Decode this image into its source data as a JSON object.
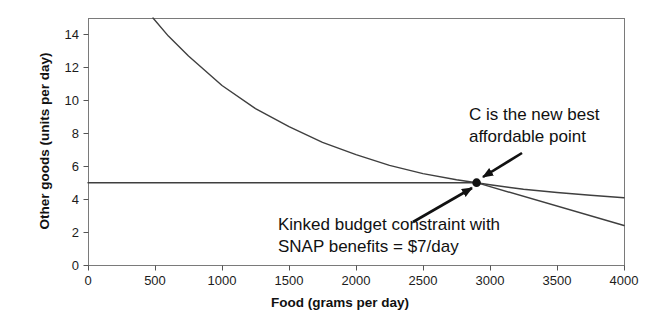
{
  "colors": {
    "curve_line": "#3f3f3f",
    "frame": "#7a7a7a",
    "tick": "#555555",
    "text": "#111111",
    "point_and_arrows": "#111111",
    "background": "#ffffff"
  },
  "chart_data": {
    "type": "line",
    "title": "",
    "xlabel": "Food (grams per day)",
    "ylabel": "Other goods (units per day)",
    "xlim": [
      0,
      4000
    ],
    "ylim": [
      0,
      15
    ],
    "x_ticks": [
      0,
      500,
      1000,
      1500,
      2000,
      2500,
      3000,
      3500,
      4000
    ],
    "y_ticks": [
      0,
      2,
      4,
      6,
      8,
      10,
      12,
      14
    ],
    "grid": false,
    "legend": false,
    "series": [
      {
        "name": "indifference curve",
        "points": [
          [
            485,
            15
          ],
          [
            600,
            13.9
          ],
          [
            750,
            12.7
          ],
          [
            1000,
            10.9
          ],
          [
            1250,
            9.5
          ],
          [
            1500,
            8.4
          ],
          [
            1750,
            7.45
          ],
          [
            2000,
            6.7
          ],
          [
            2250,
            6.05
          ],
          [
            2500,
            5.55
          ],
          [
            2750,
            5.18
          ],
          [
            2900,
            5.0
          ],
          [
            3000,
            4.87
          ],
          [
            3250,
            4.6
          ],
          [
            3500,
            4.4
          ],
          [
            3750,
            4.23
          ],
          [
            4000,
            4.08
          ]
        ]
      },
      {
        "name": "kinked budget constraint with SNAP benefits",
        "points": [
          [
            0,
            5
          ],
          [
            2900,
            5
          ],
          [
            4000,
            2.4
          ]
        ]
      }
    ],
    "point": {
      "label": "C",
      "x": 2900,
      "y": 5
    },
    "annotations": [
      {
        "id": "c-point-label",
        "text": "C is the new best\naffordable point",
        "pos": [
          469,
          104
        ],
        "arrow": {
          "from": [
            522,
            153
          ],
          "to": [
            483,
            177
          ]
        }
      },
      {
        "id": "kink-label",
        "text": "Kinked budget constraint with\nSNAP benefits = $7/day",
        "pos": [
          278,
          214
        ],
        "arrow": {
          "from": [
            413,
            222
          ],
          "to": [
            472,
            188
          ]
        }
      }
    ]
  }
}
